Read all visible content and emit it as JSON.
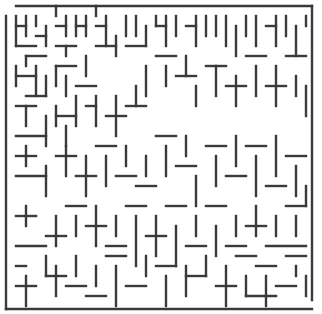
{
  "maze": {
    "width": 322,
    "height": 314,
    "wall_color": "#3a3a3a",
    "background": "#ffffff",
    "border": {
      "x0": 6,
      "y0": 6,
      "x1": 312,
      "y1": 309
    },
    "segments": [
      [
        16,
        6,
        312,
        6
      ],
      [
        6,
        16,
        6,
        309
      ],
      [
        6,
        309,
        312,
        309
      ],
      [
        312,
        6,
        312,
        300
      ],
      [
        16,
        16,
        16,
        46
      ],
      [
        16,
        26,
        26,
        26
      ],
      [
        26,
        16,
        26,
        36
      ],
      [
        36,
        16,
        36,
        26
      ],
      [
        16,
        46,
        36,
        46
      ],
      [
        36,
        36,
        46,
        36
      ],
      [
        46,
        26,
        46,
        46
      ],
      [
        26,
        56,
        46,
        56
      ],
      [
        26,
        56,
        26,
        66
      ],
      [
        56,
        6,
        56,
        16
      ],
      [
        56,
        26,
        66,
        26
      ],
      [
        66,
        16,
        66,
        36
      ],
      [
        56,
        46,
        76,
        46
      ],
      [
        66,
        46,
        66,
        56
      ],
      [
        76,
        16,
        76,
        36
      ],
      [
        76,
        26,
        86,
        26
      ],
      [
        86,
        16,
        86,
        36
      ],
      [
        96,
        6,
        96,
        16
      ],
      [
        16,
        66,
        16,
        86
      ],
      [
        16,
        76,
        36,
        76
      ],
      [
        36,
        66,
        36,
        96
      ],
      [
        46,
        76,
        46,
        96
      ],
      [
        26,
        96,
        46,
        96
      ],
      [
        56,
        66,
        56,
        86
      ],
      [
        56,
        66,
        76,
        66
      ],
      [
        66,
        76,
        66,
        96
      ],
      [
        76,
        86,
        96,
        86
      ],
      [
        86,
        56,
        86,
        76
      ],
      [
        96,
        26,
        106,
        26
      ],
      [
        106,
        16,
        106,
        46
      ],
      [
        96,
        46,
        116,
        46
      ],
      [
        116,
        36,
        116,
        56
      ],
      [
        126,
        16,
        126,
        36
      ],
      [
        136,
        16,
        136,
        36
      ],
      [
        126,
        46,
        146,
        46
      ],
      [
        146,
        26,
        146,
        46
      ],
      [
        156,
        16,
        156,
        26
      ],
      [
        156,
        26,
        166,
        26
      ],
      [
        166,
        16,
        166,
        46
      ],
      [
        176,
        16,
        176,
        36
      ],
      [
        186,
        26,
        196,
        26
      ],
      [
        196,
        16,
        196,
        46
      ],
      [
        206,
        16,
        206,
        36
      ],
      [
        216,
        16,
        216,
        36
      ],
      [
        226,
        16,
        226,
        46
      ],
      [
        236,
        26,
        236,
        56
      ],
      [
        246,
        16,
        246,
        36
      ],
      [
        256,
        16,
        256,
        46
      ],
      [
        266,
        26,
        276,
        26
      ],
      [
        276,
        16,
        276,
        46
      ],
      [
        286,
        16,
        286,
        36
      ],
      [
        296,
        26,
        296,
        56
      ],
      [
        306,
        16,
        306,
        26
      ],
      [
        16,
        106,
        36,
        106
      ],
      [
        26,
        106,
        26,
        126
      ],
      [
        16,
        136,
        46,
        136
      ],
      [
        46,
        116,
        46,
        146
      ],
      [
        56,
        106,
        56,
        126
      ],
      [
        56,
        116,
        76,
        116
      ],
      [
        66,
        126,
        66,
        146
      ],
      [
        76,
        96,
        76,
        126
      ],
      [
        86,
        106,
        96,
        106
      ],
      [
        96,
        96,
        96,
        126
      ],
      [
        106,
        116,
        126,
        116
      ],
      [
        116,
        96,
        116,
        136
      ],
      [
        126,
        106,
        146,
        106
      ],
      [
        136,
        86,
        136,
        106
      ],
      [
        146,
        66,
        146,
        96
      ],
      [
        156,
        56,
        176,
        56
      ],
      [
        166,
        66,
        166,
        86
      ],
      [
        176,
        76,
        196,
        76
      ],
      [
        186,
        56,
        186,
        76
      ],
      [
        196,
        86,
        196,
        106
      ],
      [
        206,
        66,
        226,
        66
      ],
      [
        216,
        66,
        216,
        96
      ],
      [
        226,
        86,
        246,
        86
      ],
      [
        236,
        76,
        236,
        106
      ],
      [
        246,
        56,
        266,
        56
      ],
      [
        256,
        66,
        256,
        96
      ],
      [
        266,
        86,
        286,
        86
      ],
      [
        276,
        66,
        276,
        106
      ],
      [
        286,
        56,
        306,
        56
      ],
      [
        296,
        76,
        296,
        96
      ],
      [
        306,
        86,
        306,
        116
      ],
      [
        16,
        156,
        36,
        156
      ],
      [
        26,
        146,
        26,
        166
      ],
      [
        16,
        176,
        46,
        176
      ],
      [
        46,
        166,
        46,
        196
      ],
      [
        56,
        156,
        76,
        156
      ],
      [
        66,
        146,
        66,
        176
      ],
      [
        76,
        176,
        96,
        176
      ],
      [
        86,
        156,
        86,
        196
      ],
      [
        96,
        146,
        116,
        146
      ],
      [
        106,
        156,
        106,
        186
      ],
      [
        116,
        176,
        136,
        176
      ],
      [
        126,
        146,
        126,
        166
      ],
      [
        136,
        186,
        156,
        186
      ],
      [
        146,
        156,
        146,
        176
      ],
      [
        156,
        136,
        176,
        136
      ],
      [
        166,
        146,
        166,
        176
      ],
      [
        176,
        166,
        196,
        166
      ],
      [
        186,
        136,
        186,
        156
      ],
      [
        196,
        176,
        196,
        206
      ],
      [
        206,
        146,
        226,
        146
      ],
      [
        216,
        156,
        216,
        186
      ],
      [
        226,
        176,
        246,
        176
      ],
      [
        236,
        136,
        236,
        166
      ],
      [
        246,
        146,
        266,
        146
      ],
      [
        256,
        156,
        256,
        196
      ],
      [
        266,
        186,
        286,
        186
      ],
      [
        276,
        136,
        276,
        176
      ],
      [
        286,
        156,
        306,
        156
      ],
      [
        296,
        166,
        296,
        196
      ],
      [
        306,
        186,
        306,
        206
      ],
      [
        16,
        216,
        36,
        216
      ],
      [
        26,
        206,
        26,
        226
      ],
      [
        46,
        236,
        66,
        236
      ],
      [
        56,
        216,
        56,
        246
      ],
      [
        16,
        246,
        46,
        246
      ],
      [
        66,
        206,
        86,
        206
      ],
      [
        76,
        216,
        76,
        236
      ],
      [
        86,
        226,
        106,
        226
      ],
      [
        96,
        206,
        96,
        246
      ],
      [
        106,
        246,
        126,
        246
      ],
      [
        116,
        216,
        116,
        236
      ],
      [
        126,
        206,
        146,
        206
      ],
      [
        136,
        216,
        136,
        266
      ],
      [
        146,
        236,
        166,
        236
      ],
      [
        156,
        216,
        156,
        256
      ],
      [
        166,
        206,
        186,
        206
      ],
      [
        176,
        226,
        176,
        266
      ],
      [
        186,
        246,
        206,
        246
      ],
      [
        196,
        216,
        196,
        236
      ],
      [
        206,
        206,
        226,
        206
      ],
      [
        216,
        226,
        216,
        256
      ],
      [
        226,
        246,
        246,
        246
      ],
      [
        236,
        216,
        236,
        236
      ],
      [
        246,
        226,
        266,
        226
      ],
      [
        256,
        206,
        256,
        236
      ],
      [
        266,
        246,
        306,
        246
      ],
      [
        276,
        216,
        276,
        236
      ],
      [
        286,
        206,
        306,
        206
      ],
      [
        296,
        216,
        296,
        236
      ],
      [
        16,
        266,
        26,
        266
      ],
      [
        16,
        286,
        36,
        286
      ],
      [
        26,
        276,
        26,
        306
      ],
      [
        46,
        256,
        46,
        276
      ],
      [
        46,
        276,
        66,
        276
      ],
      [
        56,
        266,
        56,
        296
      ],
      [
        66,
        286,
        86,
        286
      ],
      [
        76,
        256,
        76,
        276
      ],
      [
        86,
        296,
        106,
        296
      ],
      [
        96,
        266,
        96,
        286
      ],
      [
        106,
        256,
        126,
        256
      ],
      [
        116,
        266,
        116,
        306
      ],
      [
        126,
        286,
        146,
        286
      ],
      [
        146,
        256,
        146,
        276
      ],
      [
        156,
        266,
        176,
        266
      ],
      [
        166,
        276,
        166,
        306
      ],
      [
        186,
        266,
        186,
        296
      ],
      [
        186,
        276,
        206,
        276
      ],
      [
        206,
        256,
        206,
        276
      ],
      [
        216,
        286,
        236,
        286
      ],
      [
        226,
        266,
        226,
        306
      ],
      [
        236,
        256,
        256,
        256
      ],
      [
        246,
        276,
        246,
        296
      ],
      [
        256,
        266,
        276,
        266
      ],
      [
        266,
        276,
        266,
        306
      ],
      [
        276,
        286,
        296,
        286
      ],
      [
        286,
        256,
        306,
        256
      ],
      [
        296,
        266,
        296,
        276
      ],
      [
        306,
        276,
        306,
        296
      ],
      [
        246,
        296,
        276,
        296
      ]
    ]
  }
}
